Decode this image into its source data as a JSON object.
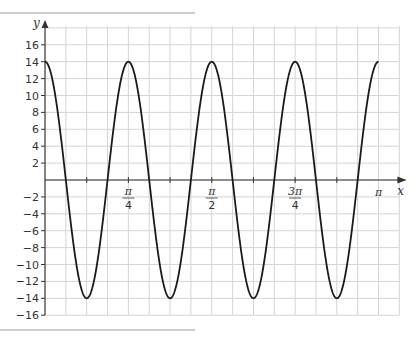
{
  "chart_data": {
    "type": "line",
    "title": "",
    "xlabel": "x",
    "ylabel": "y",
    "function": "y = 14cos(8x)",
    "xlim": [
      0,
      3.14159
    ],
    "ylim": [
      -16,
      16
    ],
    "grid": true,
    "x_ticks": [
      {
        "value": 0.7854,
        "num": "π",
        "den": "4"
      },
      {
        "value": 1.5708,
        "num": "π",
        "den": "2"
      },
      {
        "value": 2.3562,
        "num": "3π",
        "den": "4"
      },
      {
        "value": 3.1416,
        "num": "π",
        "den": ""
      }
    ],
    "y_ticks": [
      16,
      14,
      12,
      10,
      8,
      6,
      4,
      2,
      -2,
      -4,
      -6,
      -8,
      -10,
      -12,
      -14,
      -16
    ],
    "series": [
      {
        "name": "curve",
        "amplitude": 14,
        "frequency": 8,
        "maxima_x": [
          0,
          0.7854,
          1.5708,
          2.3562,
          3.1416
        ],
        "minima_x": [
          0.3927,
          1.1781,
          1.9635,
          2.7489
        ],
        "max_value": 14,
        "min_value": -14
      }
    ]
  },
  "colors": {
    "grid": "#d4d4d4",
    "axis": "#333333",
    "curve": "#1a1a1a",
    "rule": "#9a9a9a"
  }
}
